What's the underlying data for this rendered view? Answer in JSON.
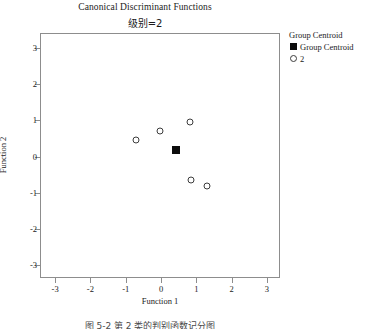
{
  "chart_data": {
    "type": "scatter",
    "title": "Canonical Discriminant Functions",
    "subtitle": "级别=2",
    "xlabel": "Function 1",
    "ylabel": "Function 2",
    "xlim": [
      -3.4,
      3.4
    ],
    "ylim": [
      -3.4,
      3.4
    ],
    "xticks": [
      -3,
      -2,
      -1,
      0,
      1,
      2,
      3
    ],
    "xtick_labels": [
      "-3",
      "-2",
      "-1",
      "0",
      "1",
      "2",
      "3"
    ],
    "yticks": [
      -3,
      -2,
      -1,
      0,
      1,
      2,
      3
    ],
    "ytick_labels": [
      "-3",
      "-2",
      "-1",
      "0",
      "1",
      "2",
      "3"
    ],
    "grid": false,
    "legend_position": "right",
    "series": [
      {
        "name": "2",
        "marker": "open-circle",
        "color": "#3c3c3c",
        "points": [
          {
            "x": -0.72,
            "y": 0.45
          },
          {
            "x": -0.02,
            "y": 0.7
          },
          {
            "x": 0.82,
            "y": 0.95
          },
          {
            "x": 0.86,
            "y": -0.64
          },
          {
            "x": 1.29,
            "y": -0.82
          }
        ]
      },
      {
        "name": "Group Centroid",
        "marker": "filled-square",
        "color": "#0c0c0c",
        "points": [
          {
            "x": 0.43,
            "y": 0.18
          }
        ]
      }
    ]
  },
  "legend": {
    "title": "Group Centroid",
    "entries": [
      {
        "label": "Group Centroid",
        "marker": "filled-square"
      },
      {
        "label": "2",
        "marker": "open-circle"
      }
    ]
  },
  "caption": {
    "text": "图 5-2  第 2 类的判别函数记分图"
  }
}
